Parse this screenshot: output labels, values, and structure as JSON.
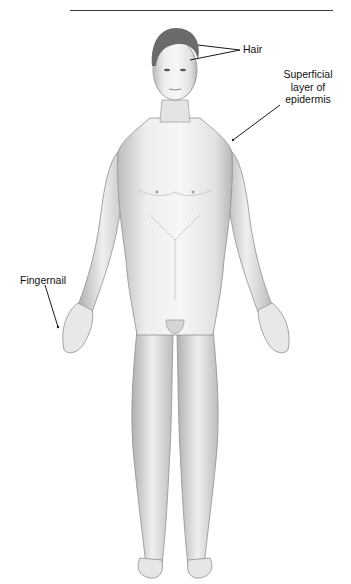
{
  "figure": {
    "labels": [
      {
        "id": "hair",
        "text": "Hair"
      },
      {
        "id": "superficial",
        "lines": [
          "Superficial",
          "layer of",
          "epidermis"
        ]
      },
      {
        "id": "fingernail",
        "text": "Fingernail"
      }
    ]
  },
  "colors": {
    "skin_light": "#f2f2f2",
    "skin_mid": "#d8d8d8",
    "skin_shadow": "#a8a8a8",
    "hair": "#6b6b6b",
    "line": "#1a1a1a"
  }
}
